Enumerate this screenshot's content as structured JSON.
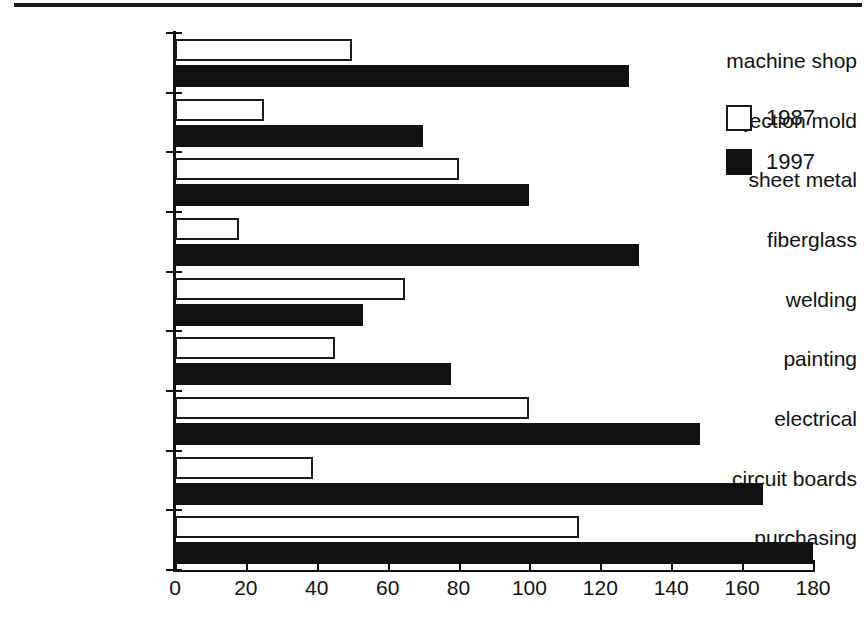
{
  "page": {
    "top_rule": "page-top-rule"
  },
  "chart_data": {
    "type": "bar",
    "orientation": "horizontal",
    "grouped": true,
    "title": "",
    "subtitle": "",
    "xlabel": "",
    "ylabel": "",
    "xlim": [
      0,
      180
    ],
    "xticks": [
      0,
      20,
      40,
      60,
      80,
      100,
      120,
      140,
      160,
      180
    ],
    "xtick_labels": [
      "0",
      "20",
      "40",
      "60",
      "80",
      "100",
      "120",
      "140",
      "160",
      "180"
    ],
    "grid": false,
    "legend_position": "upper-right",
    "categories": [
      "machine shop",
      "injection mold",
      "sheet metal",
      "fiberglass",
      "welding",
      "painting",
      "electrical",
      "circuit boards",
      "purchasing"
    ],
    "series": [
      {
        "name": "1987",
        "color": "#ffffff",
        "edge_color": "#1a1a1a",
        "values": [
          50,
          25,
          80,
          18,
          65,
          45,
          100,
          39,
          114
        ]
      },
      {
        "name": "1997",
        "color": "#111111",
        "edge_color": "#111111",
        "values": [
          128,
          70,
          100,
          131,
          53,
          78,
          148,
          166,
          180
        ]
      }
    ]
  },
  "legend": {
    "entries": [
      {
        "label": "1987",
        "swatch": "open-square-swatch"
      },
      {
        "label": "1997",
        "swatch": "filled-square-swatch"
      }
    ]
  }
}
